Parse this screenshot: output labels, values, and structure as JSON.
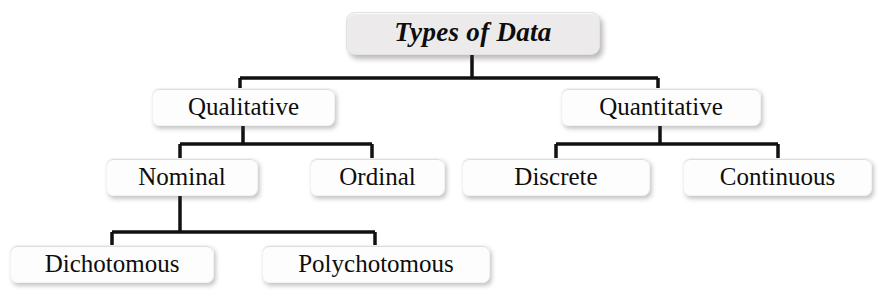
{
  "diagram": {
    "title": "Types of Data",
    "type": "hierarchy-tree",
    "orientation": "top-down",
    "levels": 4,
    "colors": {
      "root_fill": "#eceaea",
      "node_fill": "#fdfdfd",
      "line": "#111111",
      "text": "#0d0d0d",
      "background": "#ffffff"
    },
    "nodes": {
      "root": {
        "label": "Types of Data"
      },
      "qualitative": {
        "label": "Qualitative"
      },
      "quantitative": {
        "label": "Quantitative"
      },
      "nominal": {
        "label": "Nominal"
      },
      "ordinal": {
        "label": "Ordinal"
      },
      "discrete": {
        "label": "Discrete"
      },
      "continuous": {
        "label": "Continuous"
      },
      "dichotomous": {
        "label": "Dichotomous"
      },
      "polychotomous": {
        "label": "Polychotomous"
      }
    },
    "edges": [
      {
        "from": "root",
        "to": "qualitative"
      },
      {
        "from": "root",
        "to": "quantitative"
      },
      {
        "from": "qualitative",
        "to": "nominal"
      },
      {
        "from": "qualitative",
        "to": "ordinal"
      },
      {
        "from": "quantitative",
        "to": "discrete"
      },
      {
        "from": "quantitative",
        "to": "continuous"
      },
      {
        "from": "nominal",
        "to": "dichotomous"
      },
      {
        "from": "nominal",
        "to": "polychotomous"
      }
    ]
  }
}
